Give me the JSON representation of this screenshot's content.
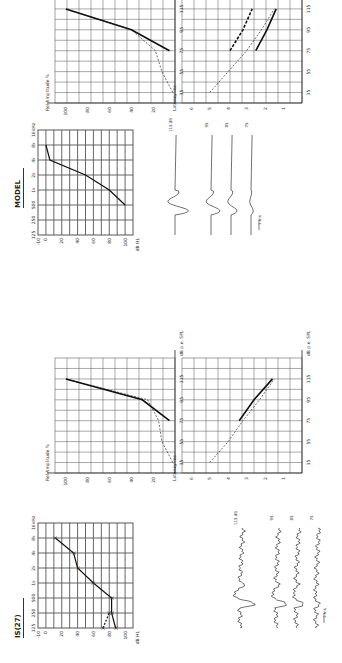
{
  "figure": {
    "panels": [
      {
        "id": "patient",
        "title": "IS(27)"
      },
      {
        "id": "model",
        "title": "MODEL"
      }
    ],
    "axis_labels": {
      "audiogram_freq": [
        "125",
        "250",
        "500",
        "1k",
        "2k",
        "4k",
        "8k",
        "16kHz"
      ],
      "audiogram_level": [
        "-10",
        "0",
        "20",
        "40",
        "60",
        "80",
        "100"
      ],
      "audiogram_unit": "dB HL",
      "amplitude_y": [
        "100",
        "80",
        "60",
        "40",
        "20"
      ],
      "amplitude_ylabel": "Rel Amplitude %",
      "latency_y": [
        "6",
        "5",
        "4",
        "3",
        "2",
        "1"
      ],
      "latency_ylabel": "Latency ms",
      "level_x": [
        "35",
        "55",
        "75",
        "95",
        "115"
      ],
      "level_xlabel": "dB p.e. SPL"
    },
    "waveform_labels": [
      "115 dB",
      "95",
      "85",
      "75"
    ],
    "scale_bar": "1 ms"
  },
  "chart_data": [
    {
      "type": "line",
      "title": "IS(27) audiogram",
      "x": [
        "125",
        "250",
        "500",
        "1k",
        "2k",
        "4k",
        "8k"
      ],
      "series": [
        {
          "name": "threshold",
          "values": [
            88,
            83,
            83,
            60,
            40,
            35,
            12
          ]
        },
        {
          "name": "threshold (dashed)",
          "values": [
            72,
            80,
            null,
            null,
            null,
            null,
            null
          ]
        }
      ],
      "xlabel": "Frequency (Hz)",
      "ylabel": "dB HL",
      "ylim": [
        -10,
        110
      ]
    },
    {
      "type": "line",
      "title": "IS(27) relative amplitude",
      "x": [
        35,
        55,
        75,
        95,
        115
      ],
      "series": [
        {
          "name": "patient",
          "values": [
            null,
            null,
            5,
            30,
            100
          ]
        },
        {
          "name": "normal (dashed)",
          "values": [
            2,
            12,
            15,
            25,
            100
          ]
        }
      ],
      "xlabel": "dB p.e. SPL",
      "ylabel": "Rel Amplitude %",
      "ylim": [
        0,
        110
      ]
    },
    {
      "type": "line",
      "title": "IS(27) latency",
      "x": [
        35,
        55,
        75,
        95,
        115
      ],
      "series": [
        {
          "name": "patient",
          "values": [
            null,
            null,
            3.4,
            2.6,
            1.6
          ]
        },
        {
          "name": "normal (dashed)",
          "values": [
            5.0,
            4.0,
            3.2,
            2.3,
            1.5
          ]
        }
      ],
      "xlabel": "dB p.e. SPL",
      "ylabel": "Latency ms",
      "ylim": [
        0,
        6.5
      ]
    },
    {
      "type": "line",
      "title": "MODEL audiogram",
      "x": [
        "125",
        "250",
        "500",
        "1k",
        "2k",
        "4k",
        "8k"
      ],
      "series": [
        {
          "name": "threshold",
          "values": [
            null,
            null,
            100,
            80,
            50,
            5,
            0
          ]
        }
      ],
      "xlabel": "Frequency (Hz)",
      "ylabel": "dB HL",
      "ylim": [
        -10,
        110
      ]
    },
    {
      "type": "line",
      "title": "MODEL relative amplitude",
      "x": [
        35,
        55,
        75,
        95,
        115
      ],
      "series": [
        {
          "name": "model",
          "values": [
            null,
            null,
            5,
            40,
            100
          ]
        },
        {
          "name": "normal (dashed)",
          "values": [
            2,
            12,
            18,
            40,
            100
          ]
        }
      ],
      "xlabel": "dB p.e. SPL",
      "ylabel": "Rel Amplitude %",
      "ylim": [
        0,
        110
      ]
    },
    {
      "type": "line",
      "title": "MODEL latency",
      "x": [
        35,
        55,
        75,
        95,
        115
      ],
      "series": [
        {
          "name": "wave I (dashed bold)",
          "values": [
            null,
            null,
            3.9,
            3.2,
            2.7
          ]
        },
        {
          "name": "wave V",
          "values": [
            null,
            null,
            2.5,
            1.9,
            1.4
          ]
        },
        {
          "name": "normal (dashed)",
          "values": [
            5.0,
            4.0,
            3.0,
            2.2,
            1.5
          ]
        }
      ],
      "xlabel": "dB p.e. SPL",
      "ylabel": "Latency ms",
      "ylim": [
        0,
        6.5
      ]
    }
  ]
}
